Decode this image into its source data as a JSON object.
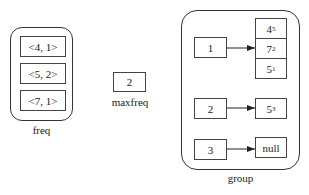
{
  "freq": {
    "label": "freq",
    "items": [
      "<4, 1>",
      "<5, 2>",
      "<7, 1>"
    ]
  },
  "maxfreq": {
    "label": "maxfreq",
    "value": "2"
  },
  "group": {
    "label": "group",
    "rows": [
      {
        "key": "1",
        "stack": [
          {
            "v": "4",
            "s": "5"
          },
          {
            "v": "7",
            "s": "2"
          },
          {
            "v": "5",
            "s": "1"
          }
        ]
      },
      {
        "key": "2",
        "stack": [
          {
            "v": "5",
            "s": "3"
          }
        ]
      },
      {
        "key": "3",
        "stack": [
          {
            "v": "null",
            "s": ""
          }
        ]
      }
    ]
  }
}
